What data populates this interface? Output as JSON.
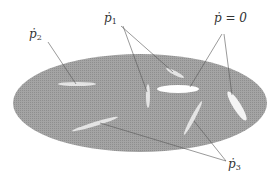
{
  "diagram": {
    "region_color": "#9a9a9a",
    "leaf_color": "#e6e6e6",
    "zero_leaf_color": "#ffffff",
    "line_color": "#555555",
    "labels": {
      "p1": {
        "base": "ṗ",
        "sub": "1"
      },
      "p2": {
        "base": "ṗ",
        "sub": "2"
      },
      "p3": {
        "base": "ṗ",
        "sub": "3"
      },
      "p0": {
        "text": "ṗ = 0"
      }
    }
  }
}
